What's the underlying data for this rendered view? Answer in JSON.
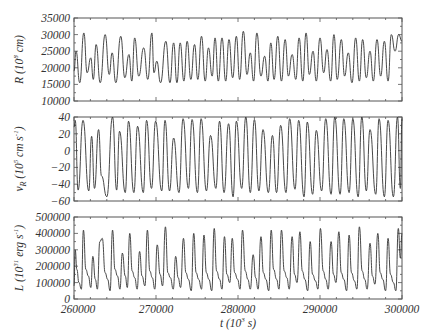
{
  "chart_data": [
    {
      "type": "line",
      "panel": "top",
      "title": "",
      "xlabel": "",
      "ylabel": "R (10^8 cm)",
      "ylabel_parts": {
        "main": "R",
        "open": " (10",
        "sup": "8",
        "unit": " cm)"
      },
      "xlim": [
        260000,
        300000
      ],
      "ylim": [
        10000,
        35000
      ],
      "yticks": [
        10000,
        15000,
        20000,
        25000,
        30000,
        35000
      ],
      "ytick_labels": [
        "10000",
        "15000",
        "20000",
        "25000",
        "30000",
        "35000"
      ],
      "grid": false,
      "legend": null,
      "series": [
        {
          "name": "R",
          "x": [
            260000,
            260250,
            260700,
            261200,
            261600,
            262050,
            262350,
            262700,
            263200,
            263800,
            264300,
            264650,
            265100,
            265700,
            266200,
            266700,
            267050,
            267400,
            267900,
            268500,
            269000,
            269500,
            269750,
            270100,
            270550,
            271200,
            271700,
            272150,
            272550,
            272950,
            273400,
            273800,
            274250,
            274700,
            275100,
            275550,
            276000,
            276400,
            276850,
            277200,
            277600,
            278050,
            278500,
            278900,
            279350,
            279800,
            280200,
            280650,
            281100,
            281500,
            281900,
            282300,
            282800,
            283250,
            283650,
            284000,
            284400,
            284850,
            285300,
            285750,
            286150,
            286600,
            287050,
            287450,
            287900,
            288300,
            288700,
            289150,
            289550,
            290000,
            290450,
            290850,
            291300,
            291700,
            292100,
            292600,
            293000,
            293450,
            293900,
            294350,
            294800,
            295200,
            295650,
            296100,
            296500,
            296950,
            297400,
            297850,
            298300,
            298700,
            299150,
            299600,
            300000
          ],
          "y": [
            19000,
            25000,
            15500,
            30500,
            18500,
            23000,
            16500,
            27000,
            15500,
            30000,
            18000,
            24500,
            15500,
            29500,
            17000,
            24000,
            16000,
            29000,
            17500,
            26000,
            16500,
            30500,
            18500,
            22000,
            15500,
            28000,
            15500,
            27500,
            15500,
            27500,
            16000,
            28000,
            16500,
            27000,
            16500,
            29500,
            16000,
            26000,
            17500,
            29000,
            16000,
            29000,
            16000,
            28500,
            17000,
            29500,
            16500,
            31000,
            18000,
            24500,
            16000,
            30500,
            17500,
            23500,
            16000,
            27500,
            16500,
            29500,
            16000,
            28500,
            17500,
            24000,
            16500,
            29000,
            16000,
            30500,
            18000,
            25000,
            16000,
            29000,
            18500,
            25500,
            16000,
            30000,
            16500,
            28500,
            17500,
            24500,
            15500,
            29000,
            16000,
            28500,
            17000,
            25000,
            16000,
            28500,
            17500,
            28000,
            16000,
            30000,
            25000,
            30000,
            28000
          ]
        }
      ]
    },
    {
      "type": "line",
      "panel": "middle",
      "title": "",
      "xlabel": "",
      "ylabel": "v_R (10^5 cm s^-1)",
      "ylabel_parts": {
        "main": "v",
        "sub": "R",
        "open": " (10",
        "sup": "5",
        "unit": " cm s",
        "sup2": "-1",
        "close": ")"
      },
      "xlim": [
        260000,
        300000
      ],
      "ylim": [
        -60,
        40
      ],
      "yticks": [
        -60,
        -40,
        -20,
        0,
        20,
        40
      ],
      "ytick_labels": [
        "-60",
        "-40",
        "-20",
        "0",
        "20",
        "40"
      ],
      "grid": false,
      "legend": null,
      "series": [
        {
          "name": "v_R",
          "x": [
            260000,
            260150,
            260500,
            261100,
            261800,
            262150,
            262500,
            263000,
            263350,
            264000,
            264700,
            265200,
            265550,
            266250,
            266650,
            267300,
            267750,
            268450,
            268850,
            269450,
            269950,
            270700,
            271100,
            271650,
            272150,
            272800,
            273300,
            273950,
            274400,
            275050,
            275500,
            276150,
            276650,
            277300,
            277750,
            278300,
            278850,
            279400,
            279800,
            280450,
            280950,
            281500,
            282000,
            282550,
            283050,
            283700,
            284200,
            284700,
            285200,
            285850,
            286300,
            286950,
            287400,
            288050,
            288450,
            289100,
            289550,
            290200,
            290700,
            291350,
            291800,
            292450,
            292900,
            293550,
            294000,
            294650,
            295100,
            295650,
            296100,
            296800,
            297200,
            297850,
            298300,
            298950,
            299450,
            299800,
            300000
          ],
          "y": [
            28,
            36,
            -47,
            36,
            -48,
            17,
            -45,
            25,
            -30,
            -55,
            40,
            -47,
            23,
            -50,
            35,
            -50,
            29,
            -50,
            36,
            -45,
            35,
            -48,
            36,
            -48,
            15,
            -50,
            38,
            -45,
            37,
            -50,
            38,
            -48,
            18,
            -45,
            35,
            -50,
            32,
            -55,
            35,
            -45,
            40,
            -50,
            37,
            -48,
            25,
            -50,
            18,
            -50,
            30,
            -50,
            38,
            -46,
            36,
            -55,
            34,
            -52,
            24,
            -48,
            38,
            -52,
            40,
            -52,
            38,
            -50,
            38,
            -55,
            40,
            -48,
            25,
            -52,
            38,
            -55,
            36,
            -55,
            40,
            -45,
            38
          ]
        }
      ]
    },
    {
      "type": "line",
      "panel": "bottom",
      "title": "",
      "xlabel": "t (10^3 s)",
      "xlabel_parts": {
        "main": "t",
        "open": " (10",
        "sup": "3",
        "unit": " s)"
      },
      "ylabel": "L (10^31 erg s^-1)",
      "ylabel_parts": {
        "main": "L",
        "open": " (10",
        "sup": "31",
        "unit": " erg s",
        "sup2": "-1",
        "close": ")"
      },
      "xlim": [
        260000,
        300000
      ],
      "ylim": [
        0,
        500000
      ],
      "xticks": [
        260000,
        270000,
        280000,
        290000,
        300000
      ],
      "xtick_labels": [
        "260000",
        "270000",
        "280000",
        "290000",
        "300000"
      ],
      "yticks": [
        0,
        100000,
        200000,
        300000,
        400000,
        500000
      ],
      "ytick_labels": [
        "0",
        "100000",
        "200000",
        "300000",
        "400000",
        "500000"
      ],
      "grid": false,
      "legend": null,
      "series": [
        {
          "name": "L",
          "x": [
            260000,
            260150,
            260350,
            260600,
            260900,
            261150,
            261450,
            261750,
            262050,
            262300,
            262600,
            262850,
            263150,
            263450,
            263800,
            264100,
            264400,
            264700,
            265000,
            265300,
            265600,
            265900,
            266250,
            266500,
            266800,
            267100,
            267400,
            267700,
            268000,
            268300,
            268650,
            268950,
            269250,
            269550,
            269850,
            270150,
            270500,
            270800,
            271150,
            271450,
            271750,
            272100,
            272400,
            272700,
            273000,
            273350,
            273650,
            273950,
            274300,
            274600,
            274900,
            275200,
            275550,
            275850,
            276150,
            276450,
            276800,
            277100,
            277400,
            277750,
            278050,
            278350,
            278650,
            279000,
            279300,
            279600,
            279950,
            280250,
            280550,
            280900,
            281200,
            281500,
            281850,
            282150,
            282450,
            282800,
            283100,
            283400,
            283750,
            284050,
            284350,
            284700,
            285000,
            285300,
            285650,
            285950,
            286250,
            286600,
            286900,
            287200,
            287550,
            287850,
            288150,
            288500,
            288800,
            289100,
            289450,
            289750,
            290050,
            290400,
            290700,
            291000,
            291350,
            291650,
            291950,
            292300,
            292600,
            292900,
            293250,
            293550,
            293850,
            294200,
            294500,
            294800,
            295150,
            295450,
            295750,
            296100,
            296400,
            296700,
            297050,
            297350,
            297650,
            298000,
            298300,
            298600,
            298950,
            299250,
            299550,
            299800,
            300000
          ],
          "y": [
            80000,
            300000,
            180000,
            100000,
            60000,
            420000,
            180000,
            140000,
            70000,
            260000,
            120000,
            60000,
            350000,
            370000,
            160000,
            120000,
            50000,
            420000,
            180000,
            140000,
            60000,
            280000,
            140000,
            70000,
            400000,
            170000,
            130000,
            60000,
            290000,
            140000,
            80000,
            420000,
            170000,
            130000,
            60000,
            330000,
            150000,
            80000,
            440000,
            160000,
            130000,
            60000,
            260000,
            130000,
            70000,
            370000,
            160000,
            120000,
            50000,
            400000,
            160000,
            120000,
            60000,
            390000,
            160000,
            120000,
            50000,
            430000,
            170000,
            120000,
            60000,
            380000,
            150000,
            100000,
            370000,
            160000,
            120000,
            60000,
            420000,
            170000,
            120000,
            60000,
            270000,
            130000,
            60000,
            380000,
            160000,
            120000,
            50000,
            420000,
            180000,
            120000,
            60000,
            420000,
            170000,
            130000,
            60000,
            380000,
            150000,
            100000,
            410000,
            170000,
            120000,
            50000,
            350000,
            150000,
            110000,
            60000,
            430000,
            170000,
            120000,
            60000,
            350000,
            150000,
            100000,
            410000,
            160000,
            120000,
            50000,
            390000,
            160000,
            110000,
            60000,
            440000,
            170000,
            120000,
            60000,
            340000,
            140000,
            90000,
            400000,
            160000,
            120000,
            50000,
            370000,
            150000,
            100000,
            50000,
            430000,
            250000,
            400000
          ]
        }
      ]
    }
  ],
  "figure": {
    "plot_left": 74,
    "plot_right": 402,
    "panels": [
      {
        "top": 18,
        "bottom": 101
      },
      {
        "top": 117,
        "bottom": 201
      },
      {
        "top": 217,
        "bottom": 299
      }
    ],
    "line_color": "#333333",
    "frame_color": "#555555",
    "background": "#ffffff"
  }
}
